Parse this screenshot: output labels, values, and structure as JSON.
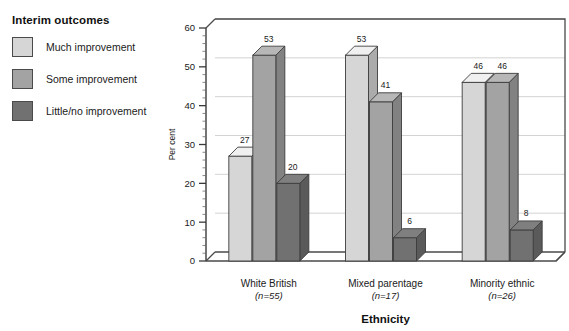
{
  "legend": {
    "title": "Interim outcomes",
    "items": [
      {
        "label": "Much improvement",
        "color": "#d6d6d6"
      },
      {
        "label": "Some improvement",
        "color": "#a3a3a3"
      },
      {
        "label": "Little/no improvement",
        "color": "#717171"
      }
    ]
  },
  "chart_data": {
    "type": "bar",
    "title": "",
    "xlabel": "Ethnicity",
    "ylabel": "Per cent",
    "ylim": [
      0,
      60
    ],
    "ytick_labels": [
      "0",
      "10",
      "20",
      "30",
      "40",
      "50",
      "60"
    ],
    "ytick_values": [
      0,
      10,
      20,
      30,
      40,
      50,
      60
    ],
    "minor_tick_step": 2,
    "grid": true,
    "legend_position": "left-outside",
    "style": "3d-column",
    "categories": [
      "White British",
      "Mixed parentage",
      "Minority ethnic"
    ],
    "category_sublabels": [
      "(n=55)",
      "(n=17)",
      "(n=26)"
    ],
    "category_n": [
      55,
      17,
      26
    ],
    "series": [
      {
        "name": "Much improvement",
        "color": "#d6d6d6",
        "values": [
          27,
          53,
          46
        ]
      },
      {
        "name": "Some improvement",
        "color": "#a3a3a3",
        "values": [
          53,
          41,
          46
        ]
      },
      {
        "name": "Little/no improvement",
        "color": "#717171",
        "values": [
          20,
          6,
          8
        ]
      }
    ]
  }
}
